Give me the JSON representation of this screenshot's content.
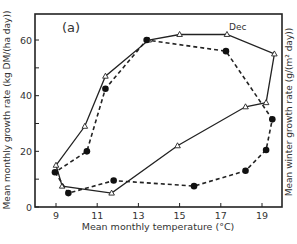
{
  "chart_data": {
    "type": "line",
    "title": "",
    "panel_label": "(a)",
    "annotation": "Dec",
    "xlabel": "Mean monthly temperature (°C)",
    "ylabel": "Mean monthly growth rate (kg DM/(ha day))",
    "ylabel_right": "Mean winter growth rate (g/(m² day))",
    "xlim": [
      8,
      20
    ],
    "ylim": [
      0,
      70
    ],
    "xticks": [
      9,
      11,
      13,
      15,
      17,
      19
    ],
    "yticks": [
      0,
      20,
      40,
      60
    ],
    "grid": false,
    "series": [
      {
        "name": "open-triangles-solid",
        "marker": "triangle-open",
        "line": "solid",
        "points": [
          {
            "x": 9.0,
            "y": 15
          },
          {
            "x": 9.3,
            "y": 7.5
          },
          {
            "x": 11.7,
            "y": 5
          },
          {
            "x": 14.9,
            "y": 22
          },
          {
            "x": 18.2,
            "y": 36
          },
          {
            "x": 19.2,
            "y": 37.5
          },
          {
            "x": 19.6,
            "y": 55
          },
          {
            "x": 17.3,
            "y": 62
          },
          {
            "x": 15.0,
            "y": 62
          },
          {
            "x": 13.5,
            "y": 60
          },
          {
            "x": 11.4,
            "y": 47
          },
          {
            "x": 10.4,
            "y": 29
          },
          {
            "x": 9.0,
            "y": 15
          }
        ]
      },
      {
        "name": "filled-circles-dashed",
        "marker": "circle-filled",
        "line": "dashed",
        "points": [
          {
            "x": 8.95,
            "y": 12.5
          },
          {
            "x": 9.6,
            "y": 5
          },
          {
            "x": 11.8,
            "y": 9.5
          },
          {
            "x": 15.7,
            "y": 7.5
          },
          {
            "x": 18.2,
            "y": 13
          },
          {
            "x": 19.2,
            "y": 20.5
          },
          {
            "x": 19.5,
            "y": 31.5
          },
          {
            "x": 17.25,
            "y": 56
          },
          {
            "x": 13.4,
            "y": 60
          },
          {
            "x": 11.4,
            "y": 42.5
          },
          {
            "x": 10.5,
            "y": 20
          },
          {
            "x": 8.95,
            "y": 12.5
          }
        ]
      }
    ]
  }
}
